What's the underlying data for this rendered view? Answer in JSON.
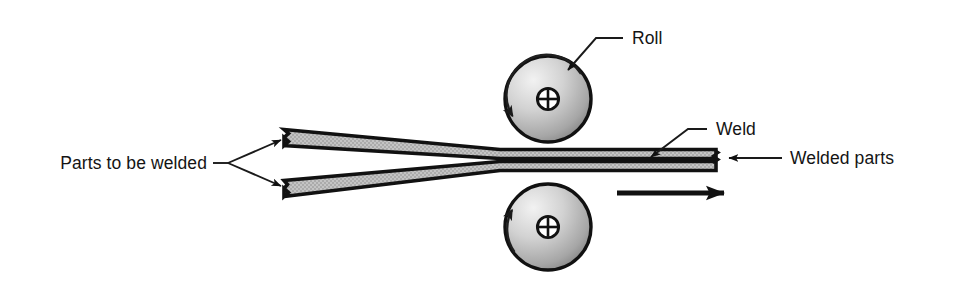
{
  "figure": {
    "background_color": "#ffffff",
    "line_color": "#111111",
    "plate_fill_color": "#a8a8a8",
    "roll_light_color": "#e8e8e8",
    "roll_dark_color": "#6e6e6e"
  },
  "labels": {
    "roll": "Roll",
    "weld": "Weld",
    "parts_to_be_welded": "Parts to be welded",
    "welded_parts": "Welded parts"
  },
  "parts": {
    "upper_roll": {
      "name": "upper roll",
      "center_x": 548,
      "center_y": 99,
      "radius": 43,
      "rotation": "counterclockwise"
    },
    "lower_roll": {
      "name": "lower roll",
      "center_x": 548,
      "center_y": 227,
      "radius": 43,
      "rotation": "clockwise"
    },
    "upper_plate": {
      "name": "upper sheet to be welded",
      "tip_x": 283,
      "tip_y": 137
    },
    "lower_plate": {
      "name": "lower sheet to be welded",
      "tip_x": 283,
      "tip_y": 188
    },
    "welded_strip": {
      "name": "welded strip exit",
      "end_x": 716
    },
    "feed_arrow": {
      "name": "feed direction arrow",
      "direction": "right",
      "from_x": 617,
      "to_x": 744,
      "y": 193
    }
  }
}
